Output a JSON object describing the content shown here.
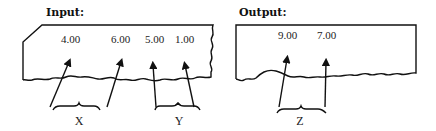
{
  "input": {
    "title": "Input:",
    "values": [
      "4.00",
      "6.00",
      "5.00",
      "1.00"
    ],
    "groups": [
      "X",
      "Y"
    ]
  },
  "output": {
    "title": "Output:",
    "values": [
      "9.00",
      "7.00"
    ],
    "groups": [
      "Z"
    ]
  }
}
